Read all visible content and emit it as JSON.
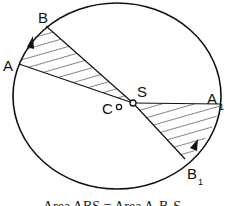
{
  "diagram": {
    "points": {
      "A": {
        "label": "A",
        "sub": ""
      },
      "B": {
        "label": "B",
        "sub": ""
      },
      "A1": {
        "label": "A",
        "sub": "1"
      },
      "B1": {
        "label": "B",
        "sub": "1"
      },
      "S": {
        "label": "S",
        "sub": ""
      },
      "C": {
        "label": "C",
        "sub": ""
      }
    },
    "regions": [
      {
        "name": "sector-ABS",
        "vertices": [
          "A",
          "B",
          "S"
        ],
        "hatched": true
      },
      {
        "name": "sector-A1B1S",
        "vertices": [
          "A1",
          "B1",
          "S"
        ],
        "hatched": true
      }
    ],
    "arrows": [
      {
        "name": "motion-arrow-AB",
        "direction": "A to B"
      },
      {
        "name": "motion-arrow-A1B1",
        "direction": "A1 to B1"
      }
    ],
    "colors": {
      "stroke": "#111111",
      "background": "#ffffff"
    },
    "caption": "Area ABS = Area A₁B₁S"
  }
}
